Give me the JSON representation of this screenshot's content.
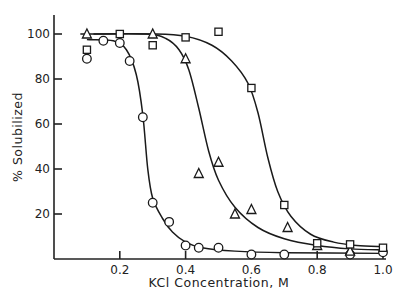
{
  "chart_data": {
    "type": "scatter",
    "title": "",
    "xlabel": "KCl Concentration, M",
    "ylabel": "% Solubilized",
    "xlim": [
      0,
      1.0
    ],
    "ylim": [
      0,
      105
    ],
    "x_ticks": [
      0.2,
      0.4,
      0.6,
      0.8,
      1.0
    ],
    "x_tick_labels": [
      "0.2",
      "0.4",
      "0.6",
      "0.8",
      "1.0"
    ],
    "y_ticks": [
      20,
      40,
      60,
      80,
      100
    ],
    "y_tick_labels": [
      "20",
      "40",
      "60",
      "80",
      "100"
    ],
    "grid": false,
    "legend": "none",
    "series": [
      {
        "name": "circles",
        "marker": "circle",
        "points": [
          [
            0.1,
            89
          ],
          [
            0.15,
            97
          ],
          [
            0.2,
            96
          ],
          [
            0.23,
            88
          ],
          [
            0.27,
            63
          ],
          [
            0.3,
            25
          ],
          [
            0.35,
            16.5
          ],
          [
            0.4,
            6
          ],
          [
            0.44,
            5
          ],
          [
            0.5,
            5
          ],
          [
            0.6,
            2
          ],
          [
            0.7,
            2
          ],
          [
            0.9,
            2
          ],
          [
            1.0,
            3
          ]
        ],
        "fit_curve": [
          [
            0.1,
            97.5
          ],
          [
            0.18,
            97
          ],
          [
            0.22,
            93
          ],
          [
            0.25,
            82
          ],
          [
            0.27,
            64
          ],
          [
            0.285,
            40
          ],
          [
            0.3,
            27
          ],
          [
            0.33,
            18
          ],
          [
            0.36,
            12
          ],
          [
            0.4,
            7.5
          ],
          [
            0.45,
            5
          ],
          [
            0.55,
            3.5
          ],
          [
            0.7,
            2.8
          ],
          [
            1.0,
            2.5
          ]
        ]
      },
      {
        "name": "triangles",
        "marker": "triangle",
        "points": [
          [
            0.1,
            100
          ],
          [
            0.3,
            100
          ],
          [
            0.4,
            89
          ],
          [
            0.44,
            38
          ],
          [
            0.5,
            43
          ],
          [
            0.55,
            20
          ],
          [
            0.6,
            22
          ],
          [
            0.71,
            14
          ],
          [
            0.8,
            6
          ],
          [
            0.9,
            3.5
          ]
        ],
        "fit_curve": [
          [
            0.12,
            100
          ],
          [
            0.28,
            100
          ],
          [
            0.34,
            98
          ],
          [
            0.38,
            93
          ],
          [
            0.41,
            84
          ],
          [
            0.44,
            67
          ],
          [
            0.47,
            48
          ],
          [
            0.5,
            35
          ],
          [
            0.55,
            23
          ],
          [
            0.62,
            14
          ],
          [
            0.7,
            9
          ],
          [
            0.8,
            6
          ],
          [
            0.9,
            4.5
          ],
          [
            1.0,
            4
          ]
        ]
      },
      {
        "name": "squares",
        "marker": "square",
        "points": [
          [
            0.1,
            93
          ],
          [
            0.2,
            100
          ],
          [
            0.3,
            95
          ],
          [
            0.4,
            98.5
          ],
          [
            0.5,
            101
          ],
          [
            0.6,
            76
          ],
          [
            0.7,
            24
          ],
          [
            0.8,
            7
          ],
          [
            0.9,
            6.5
          ],
          [
            1.0,
            5
          ]
        ],
        "fit_curve": [
          [
            0.08,
            100
          ],
          [
            0.3,
            100
          ],
          [
            0.4,
            99
          ],
          [
            0.48,
            95
          ],
          [
            0.54,
            88
          ],
          [
            0.59,
            78
          ],
          [
            0.62,
            65
          ],
          [
            0.65,
            45
          ],
          [
            0.68,
            30
          ],
          [
            0.72,
            19
          ],
          [
            0.78,
            11
          ],
          [
            0.85,
            7.5
          ],
          [
            0.92,
            6
          ],
          [
            1.0,
            5.5
          ]
        ]
      }
    ]
  },
  "labels": {
    "xlabel": "KCl Concentration, M",
    "ylabel": "% Solubilized"
  }
}
